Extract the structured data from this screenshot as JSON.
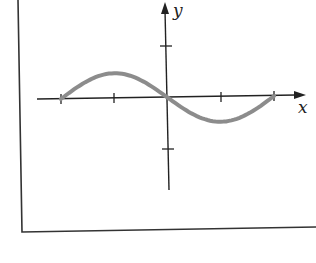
{
  "chart_data": {
    "type": "line",
    "title": "",
    "xlabel": "x",
    "ylabel": "y",
    "x": [
      -6.283,
      -4.712,
      -3.1416,
      -1.5708,
      0,
      1.5708,
      3.1416,
      4.712,
      6.283
    ],
    "series": [
      {
        "name": "curve",
        "color": "#8c8c8c",
        "function": "y = -sin(x)",
        "values_note": "domain from -2 to 2 in tick units; one tick = 1",
        "x_ticks": [
          -2,
          -1,
          0,
          1,
          2
        ],
        "points": [
          [
            -2,
            0
          ],
          [
            -1,
            0.5
          ],
          [
            0,
            0
          ],
          [
            1,
            -0.5
          ],
          [
            2,
            0
          ]
        ]
      }
    ],
    "x_tick_count": 4,
    "y_tick_count": 2,
    "xlim": [
      -2.5,
      2.6
    ],
    "ylim": [
      -1.8,
      1.9
    ],
    "grid": false,
    "legend": "none",
    "tick_labels": "none"
  },
  "labels": {
    "x_axis": "x",
    "y_axis": "y"
  },
  "colors": {
    "curve": "#8c8c8c",
    "axes": "#222222",
    "frame": "#333333"
  }
}
